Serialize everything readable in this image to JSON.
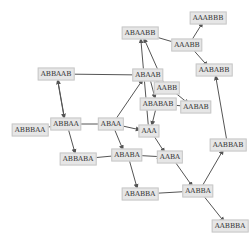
{
  "diagram": {
    "type": "directed-graph",
    "edge_color": "#555555",
    "node_fill": "#e6e6e6",
    "node_border": "#c8c8c8",
    "nodes": [
      {
        "id": "n0",
        "label": "AAABBB",
        "x": 208,
        "y": 18
      },
      {
        "id": "n1",
        "label": "ABAABB",
        "x": 140,
        "y": 33
      },
      {
        "id": "n2",
        "label": "AAABB",
        "x": 187,
        "y": 45
      },
      {
        "id": "n3",
        "label": "ABBAAB",
        "x": 56,
        "y": 74
      },
      {
        "id": "n4",
        "label": "ABAAB",
        "x": 148,
        "y": 75
      },
      {
        "id": "n5",
        "label": "AABABB",
        "x": 214,
        "y": 70
      },
      {
        "id": "n6",
        "label": "AABB",
        "x": 167,
        "y": 88
      },
      {
        "id": "n7",
        "label": "ABABAB",
        "x": 158,
        "y": 104
      },
      {
        "id": "n8",
        "label": "AABAB",
        "x": 196,
        "y": 107
      },
      {
        "id": "n9",
        "label": "ABBAA",
        "x": 66,
        "y": 124
      },
      {
        "id": "n10",
        "label": "ABAA",
        "x": 111,
        "y": 124
      },
      {
        "id": "n11",
        "label": "ABBBAA",
        "x": 30,
        "y": 130
      },
      {
        "id": "n12",
        "label": "AAA",
        "x": 149,
        "y": 131
      },
      {
        "id": "n13",
        "label": "AABA",
        "x": 170,
        "y": 157
      },
      {
        "id": "n14",
        "label": "ABBABA",
        "x": 78,
        "y": 159
      },
      {
        "id": "n15",
        "label": "ABABA",
        "x": 127,
        "y": 155
      },
      {
        "id": "n16",
        "label": "AABBAB",
        "x": 228,
        "y": 145
      },
      {
        "id": "n17",
        "label": "AABBA",
        "x": 198,
        "y": 191
      },
      {
        "id": "n18",
        "label": "ABABBA",
        "x": 140,
        "y": 194
      },
      {
        "id": "n19",
        "label": "AABBBA",
        "x": 230,
        "y": 226
      }
    ],
    "edges": [
      [
        "n9",
        "n3"
      ],
      [
        "n3",
        "n4"
      ],
      [
        "n10",
        "n4"
      ],
      [
        "n4",
        "n7"
      ],
      [
        "n4",
        "n6"
      ],
      [
        "n1",
        "n2"
      ],
      [
        "n2",
        "n5"
      ],
      [
        "n2",
        "n0"
      ],
      [
        "n6",
        "n1"
      ],
      [
        "n6",
        "n8"
      ],
      [
        "n8",
        "n7"
      ],
      [
        "n9",
        "n10"
      ],
      [
        "n9",
        "n11"
      ],
      [
        "n9",
        "n14"
      ],
      [
        "n10",
        "n12"
      ],
      [
        "n10",
        "n15"
      ],
      [
        "n12",
        "n13"
      ],
      [
        "n12",
        "n1"
      ],
      [
        "n15",
        "n13"
      ],
      [
        "n15",
        "n18"
      ],
      [
        "n14",
        "n15"
      ],
      [
        "n13",
        "n17"
      ],
      [
        "n17",
        "n18"
      ],
      [
        "n17",
        "n16"
      ],
      [
        "n17",
        "n19"
      ],
      [
        "n16",
        "n5"
      ],
      [
        "n7",
        "n12"
      ],
      [
        "n3",
        "n9"
      ]
    ]
  }
}
